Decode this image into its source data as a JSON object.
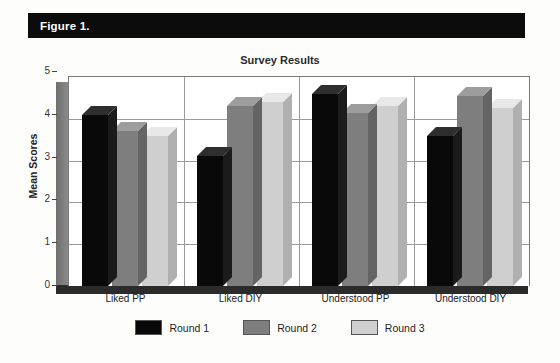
{
  "figure": {
    "header_label": "Figure 1.",
    "header_bg": "#0d0c0c",
    "header_text_color": "#ffffff"
  },
  "chart_data": {
    "type": "bar",
    "title": "Survey Results",
    "xlabel": "",
    "ylabel": "Mean Scores",
    "ylim": [
      0,
      5
    ],
    "yticks": [
      0,
      1,
      2,
      3,
      4,
      5
    ],
    "grid": true,
    "legend_position": "bottom",
    "style": "3d-clustered-column",
    "categories": [
      "Liked PP",
      "Liked DIY",
      "Understood PP",
      "Understood DIY"
    ],
    "series": [
      {
        "name": "Round 1",
        "color": "#090909",
        "values": [
          4.1,
          3.1,
          4.6,
          3.6
        ]
      },
      {
        "name": "Round 2",
        "color": "#7e7e7e",
        "values": [
          3.7,
          4.3,
          4.15,
          4.55
        ]
      },
      {
        "name": "Round 3",
        "color": "#cfcfcf",
        "values": [
          3.6,
          4.4,
          4.3,
          4.25
        ]
      }
    ]
  }
}
